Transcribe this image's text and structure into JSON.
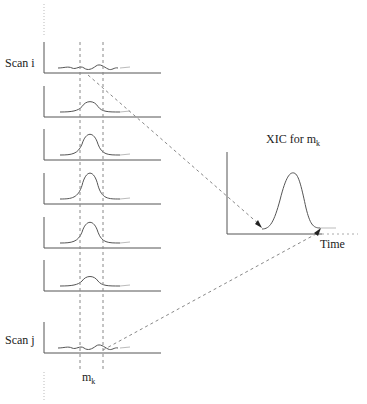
{
  "diagram": {
    "left_panel": {
      "first_scan_label": "Scan i",
      "last_scan_label": "Scan j",
      "mass_label_base": "m",
      "mass_label_sub": "k",
      "scans": [
        {
          "name": "scan-i",
          "baseline_y": 73,
          "peak_height": 3,
          "type": "noise"
        },
        {
          "name": "scan-2",
          "baseline_y": 117,
          "peak_height": 12,
          "type": "peak"
        },
        {
          "name": "scan-3",
          "baseline_y": 160,
          "peak_height": 24,
          "type": "peak"
        },
        {
          "name": "scan-4",
          "baseline_y": 204,
          "peak_height": 30,
          "type": "peak"
        },
        {
          "name": "scan-5",
          "baseline_y": 248,
          "peak_height": 24,
          "type": "peak"
        },
        {
          "name": "scan-6",
          "baseline_y": 291,
          "peak_height": 11,
          "type": "peak"
        },
        {
          "name": "scan-j",
          "baseline_y": 353,
          "peak_height": 3,
          "type": "noise"
        }
      ]
    },
    "right_panel": {
      "title_base": "XIC for m",
      "title_sub": "k",
      "x_axis_label": "Time"
    },
    "colors": {
      "line": "#555555",
      "axis": "#555555",
      "dashed": "#888888",
      "text": "#222222"
    }
  }
}
